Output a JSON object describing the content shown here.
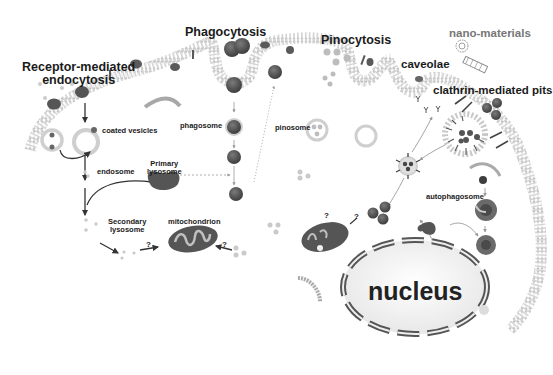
{
  "figure": {
    "type": "biological schematic",
    "palette": {
      "membrane": "#bdbdbd",
      "particle_dark": "#5a5a5a",
      "particle_light": "#c8c8c8",
      "text": "#1a1a1a",
      "label_gray": "#777777"
    }
  },
  "labels": {
    "receptor_mediated": "Receptor-mediated",
    "endocytosis": "endocytosis",
    "phagocytosis": "Phagocytosis",
    "pinocytosis": "Pinocytosis",
    "caveolae": "caveolae",
    "nano_materials": "nano-materials",
    "clathrin_pits": "clathrin-mediated pits",
    "coated_vesicles": "coated vesicles",
    "phagosome": "phagosome",
    "pinosome": "pinosome",
    "endosome": "endosome",
    "primary": "Primary",
    "lysosome": "lysosome",
    "secondary": "Secondary",
    "secondary_lysosome": "lysosome",
    "mitochondrion": "mitochondrion",
    "autophagosome": "autophagosome",
    "nucleus": "nucleus",
    "question_mark": "?"
  },
  "pathways": [
    {
      "name": "Receptor-mediated endocytosis",
      "steps": [
        "coated vesicles",
        "endosome",
        "Secondary lysosome",
        "mitochondrion"
      ]
    },
    {
      "name": "Phagocytosis",
      "steps": [
        "phagosome",
        "Primary lysosome fusion",
        "Secondary lysosome"
      ]
    },
    {
      "name": "Pinocytosis",
      "steps": [
        "pinosome"
      ]
    },
    {
      "name": "caveolae",
      "steps": [
        "cytoplasm"
      ]
    },
    {
      "name": "clathrin-mediated pits",
      "steps": [
        "coated vesicle",
        "autophagosome",
        "nucleus"
      ]
    }
  ]
}
